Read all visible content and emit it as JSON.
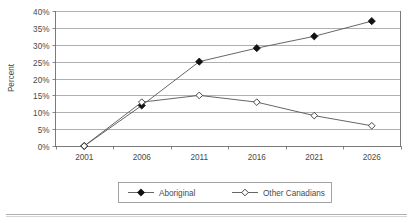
{
  "chart_data": {
    "type": "line",
    "title": "",
    "subtitle": "",
    "xlabel": "",
    "ylabel": "Percent",
    "categories": [
      "2001",
      "2006",
      "2011",
      "2016",
      "2021",
      "2026"
    ],
    "x": [
      2001,
      2006,
      2011,
      2016,
      2021,
      2026
    ],
    "series": [
      {
        "name": "Aboriginal",
        "marker": "filled-diamond",
        "values": [
          0,
          12,
          25,
          29,
          32.5,
          37
        ]
      },
      {
        "name": "Other Canadians",
        "marker": "hollow-diamond",
        "values": [
          0,
          13,
          15,
          13,
          9,
          6
        ]
      }
    ],
    "ylim": [
      0,
      40
    ],
    "ytick_values": [
      0,
      5,
      10,
      15,
      20,
      25,
      30,
      35,
      40
    ],
    "ytick_labels": [
      "0%",
      "5%",
      "10%",
      "15%",
      "20%",
      "25%",
      "30%",
      "35%",
      "40%"
    ],
    "xtick_labels": [
      "2001",
      "2006",
      "2011",
      "2016",
      "2021",
      "2026"
    ],
    "grid": true,
    "grid_axis": "y",
    "legend_position": "bottom-center",
    "legend_entries": [
      "Aboriginal",
      "Other Canadians"
    ],
    "colors": {
      "series_line": "#555555",
      "aboriginal_marker_fill": "#111111",
      "other_canadians_marker_fill": "#ffffff",
      "marker_stroke": "#333333",
      "gridline": "#8c8c8c",
      "axis": "#6b6b6b",
      "text": "#4a4a4a",
      "background": "#ffffff"
    }
  },
  "footer": {
    "rule_present": "true"
  }
}
